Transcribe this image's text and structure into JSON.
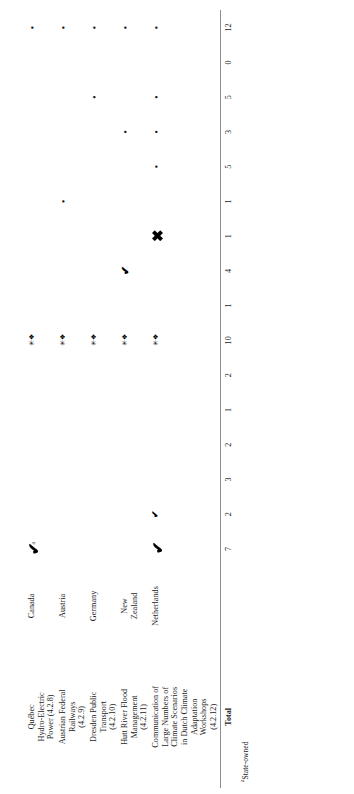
{
  "document": {
    "orientation": "rotated-90-ccw",
    "type": "table"
  },
  "table": {
    "column_headers": [
      "",
      "",
      "c1",
      "c2",
      "c3",
      "c4",
      "c5",
      "c6",
      "c7",
      "c8",
      "c9",
      "c10",
      "c11",
      "c12",
      "c13",
      "c14",
      "c15",
      "c16"
    ],
    "rows": [
      {
        "case_study": "Québec\nHydro-Electric\nPower (4.2.8)",
        "country": "Canada",
        "marks": [
          "blob",
          "",
          "",
          "",
          "",
          "",
          "cluster",
          "",
          "",
          "",
          "",
          "",
          "",
          "",
          "",
          "dot"
        ]
      },
      {
        "case_study": "Austrian Federal\nRailways\n(4.2.9)",
        "country": "Austria",
        "marks": [
          "",
          "",
          "",
          "",
          "",
          "",
          "cluster",
          "",
          "",
          "",
          "dot",
          "",
          "",
          "",
          "",
          "dot"
        ]
      },
      {
        "case_study": "Dresden Public\nTransport\n(4.2.10)",
        "country": "Germany",
        "marks": [
          "",
          "",
          "",
          "",
          "",
          "",
          "cluster",
          "",
          "",
          "",
          "",
          "",
          "",
          "dot",
          "",
          "dot"
        ]
      },
      {
        "case_study": "Hutt River Flood\nManagement\n(4.2.11)",
        "country": "New\n  Zealand",
        "marks": [
          "",
          "",
          "",
          "",
          "",
          "",
          "cluster",
          "",
          "mid",
          "",
          "",
          "",
          "dot",
          "",
          "",
          "dot"
        ]
      },
      {
        "case_study": "Communication of\nLarge Numbers of\nClimate Scenarios\nin Dutch Climate\nAdaptation\nWorkshops\n(4.2.12)",
        "country": "Netherlands",
        "marks": [
          "blob",
          "smblob",
          "",
          "",
          "",
          "",
          "cluster",
          "",
          "",
          "blob2",
          "",
          "dot",
          "dot",
          "dot",
          "",
          "dot"
        ]
      }
    ],
    "total_label": "Total",
    "totals": [
      7,
      2,
      3,
      2,
      1,
      2,
      10,
      1,
      4,
      1,
      1,
      5,
      3,
      5,
      0,
      12
    ],
    "superscript_marker": "a"
  },
  "footnote": {
    "marker": "a",
    "text": "State-owned"
  }
}
